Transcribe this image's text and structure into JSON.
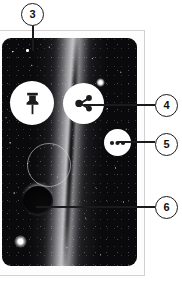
{
  "figure": {
    "type": "annotated-screenshot-diagram",
    "background_color": "#ffffff"
  },
  "device": {
    "frame_color": "#d2d2d2",
    "screen_background": "#0a0a0c"
  },
  "screen": {
    "image_subject": "milky-way-night-sky",
    "elements": [
      {
        "name": "pixel-marker",
        "icon": "white-dot-icon"
      },
      {
        "name": "bright-star-top",
        "icon": "star-glow-icon"
      },
      {
        "name": "bright-star-bottom",
        "icon": "star-glow-icon"
      },
      {
        "name": "selection-ring",
        "icon": "circle-outline-icon"
      },
      {
        "name": "dark-sphere",
        "icon": "planet-icon"
      }
    ]
  },
  "buttons": [
    {
      "name": "pin-button",
      "icon": "pin-icon",
      "label": "Pin",
      "callout": "3",
      "fill": "#ffffff"
    },
    {
      "name": "share-button",
      "icon": "share-icon",
      "label": "Share",
      "callout": "4",
      "fill": "#ffffff"
    },
    {
      "name": "more-button",
      "icon": "more-dots-icon",
      "label": "More",
      "callout": "5",
      "fill": "#ffffff"
    }
  ],
  "callouts": [
    {
      "id": "3",
      "number": "3",
      "target": "white-dot-marker-on-screen",
      "leader": "vertical"
    },
    {
      "id": "4",
      "number": "4",
      "target": "share-button",
      "leader": "horizontal"
    },
    {
      "id": "5",
      "number": "5",
      "target": "more-button",
      "leader": "horizontal"
    },
    {
      "id": "6",
      "number": "6",
      "target": "dark-sphere-object",
      "leader": "horizontal"
    }
  ],
  "colors": {
    "callout_stroke": "#1b1b1b",
    "callout_fill": "#ffffff",
    "leader_line": "#1b1b1b",
    "icon_color": "#1b1b1b"
  }
}
